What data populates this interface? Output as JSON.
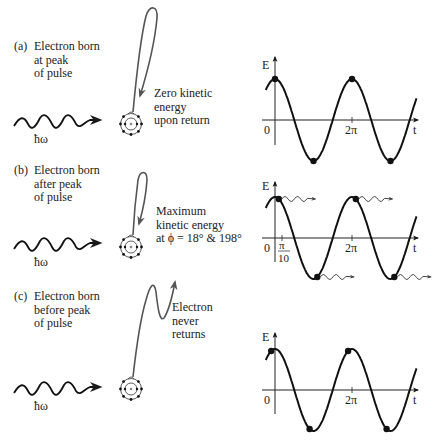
{
  "panels": [
    {
      "id": "a",
      "tag": "(a)",
      "caption_lines": [
        "Electron born",
        "at peak",
        "of pulse"
      ],
      "note_lines": [
        "Zero kinetic",
        "energy",
        "upon return"
      ],
      "photon_label": "ħω",
      "trajectory": "loop-return"
    },
    {
      "id": "b",
      "tag": "(b)",
      "caption_lines": [
        "Electron born",
        "after peak",
        "of pulse"
      ],
      "note_lines": [
        "Maximum",
        "kinetic energy",
        "at ϕ = 18° & 198°"
      ],
      "photon_label": "ħω",
      "trajectory": "small-loop-return"
    },
    {
      "id": "c",
      "tag": "(c)",
      "caption_lines": [
        "Electron born",
        "before peak",
        "of pulse"
      ],
      "note_lines": [
        "Electron",
        "never",
        "returns"
      ],
      "photon_label": "ħω",
      "trajectory": "escape"
    }
  ],
  "graphs": {
    "y_axis_label": "E",
    "x_axis_label": "t",
    "origin_label": "0",
    "two_pi_label": "2π",
    "pi_over_10": {
      "num": "π",
      "den": "10"
    }
  },
  "chart_data": [
    {
      "type": "line",
      "title": "(a) Field E(t) — electron born at peak",
      "xlabel": "t",
      "ylabel": "E",
      "function": "E = cos(t)",
      "x_ticks": [
        "0",
        "2π"
      ],
      "markers_phase": [
        0,
        3.1416,
        6.2832,
        9.4248
      ],
      "marker_note": "dots at peaks and troughs"
    },
    {
      "type": "line",
      "title": "(b) Field E(t) — electron born after peak",
      "xlabel": "t",
      "ylabel": "E",
      "function": "E = cos(t)",
      "x_ticks": [
        "0",
        "π/10",
        "2π"
      ],
      "markers_phase": [
        0.3142,
        3.4558,
        6.5974,
        9.739
      ],
      "marker_note": "dots slightly after each extremum, each emitting a wavy arrow"
    },
    {
      "type": "line",
      "title": "(c) Field E(t) — electron born before peak",
      "xlabel": "t",
      "ylabel": "E",
      "function": "E = cos(t)",
      "x_ticks": [
        "0",
        "2π"
      ],
      "markers_phase": [
        -0.3142,
        2.8274,
        5.969,
        9.1106
      ],
      "marker_note": "dots slightly before each extremum"
    }
  ]
}
